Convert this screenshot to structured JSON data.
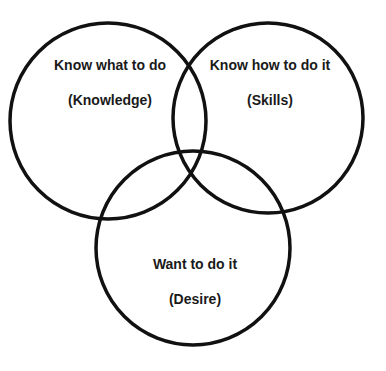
{
  "diagram": {
    "type": "venn",
    "stroke_color": "#111111",
    "background": "#ffffff",
    "circles": [
      {
        "id": "knowledge",
        "title": "Know what to do",
        "subtitle": "(Knowledge)",
        "cx": 108,
        "cy": 121,
        "r": 98
      },
      {
        "id": "skills",
        "title": "Know how to do it",
        "subtitle": "(Skills)",
        "cx": 268,
        "cy": 118,
        "r": 95
      },
      {
        "id": "desire",
        "title": "Want to do it",
        "subtitle": "(Desire)",
        "cx": 193,
        "cy": 248,
        "r": 97
      }
    ]
  }
}
